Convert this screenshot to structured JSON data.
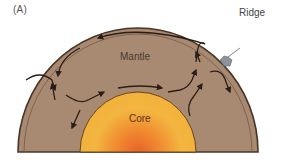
{
  "figure": {
    "panel_label": "(A)",
    "labels": {
      "mantle": "Mantle",
      "core": "Core",
      "ridge": "Ridge"
    },
    "colors": {
      "background": "#ffffff",
      "mantle": "#a88a72",
      "mantle_edge": "#4a3526",
      "crust_band": "#8a6c55",
      "core_outer": "#f3b640",
      "core_inner": "#e8622a",
      "arrows": "#2a1d15",
      "ridge": "#8c939c"
    },
    "components": [
      {
        "name": "core",
        "description": "inner yellow-orange half disc"
      },
      {
        "name": "mantle",
        "description": "brown half annulus surrounding core"
      },
      {
        "name": "lithosphere",
        "description": "thin dark outer band"
      },
      {
        "name": "ridge",
        "description": "grey bump on upper right of outer surface"
      },
      {
        "name": "convection-arrows",
        "description": "black arrows showing mantle convection cells"
      }
    ]
  }
}
